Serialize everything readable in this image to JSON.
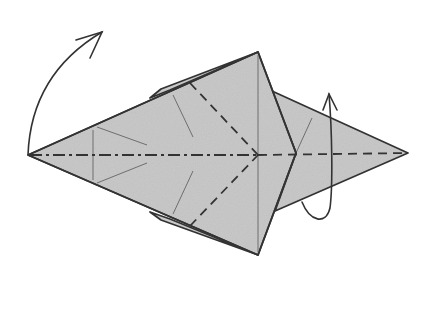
{
  "diagram": {
    "type": "origami-fold-step",
    "colors": {
      "paper": "#c9c9c9",
      "lines": "#333333",
      "creases": "#6e6e6e",
      "background": "#ffffff"
    },
    "elements": {
      "model": "kite-shaped folded base",
      "center_line": "mountain fold (dash-dot) on left half, valley fold (dashed) on right half",
      "diagonal_folds": "two valley folds from upper/lower edges converging at center point",
      "arrow_left": "curved arrow: swing left point up",
      "arrow_right": "loop arrow: fold right flap behind (turn over)"
    }
  }
}
